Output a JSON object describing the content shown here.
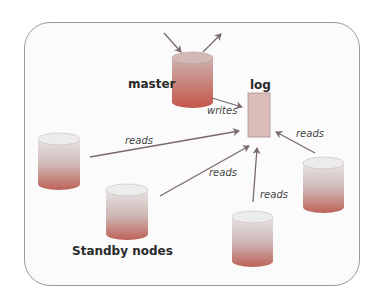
{
  "diagram": {
    "labels": {
      "master": "master",
      "log": "log",
      "writes": "writes",
      "standby": "Standby nodes",
      "reads_1": "reads",
      "reads_2": "reads",
      "reads_3": "reads",
      "reads_4": "reads"
    },
    "nodes": [
      {
        "id": "master",
        "role": "master",
        "color_top": "#c9a8a6",
        "color_bottom": "#c0574a"
      },
      {
        "id": "standby-1",
        "role": "standby",
        "color_top": "#e0e0e0",
        "color_bottom": "#b86a62"
      },
      {
        "id": "standby-2",
        "role": "standby",
        "color_top": "#e0e0e0",
        "color_bottom": "#b86a62"
      },
      {
        "id": "standby-3",
        "role": "standby",
        "color_top": "#e0e0e0",
        "color_bottom": "#b86a62"
      },
      {
        "id": "standby-4",
        "role": "standby",
        "color_top": "#e0e0e0",
        "color_bottom": "#b86a62"
      }
    ],
    "log_color": "#d9b9b6",
    "arrow_color": "#7a6a6a"
  }
}
